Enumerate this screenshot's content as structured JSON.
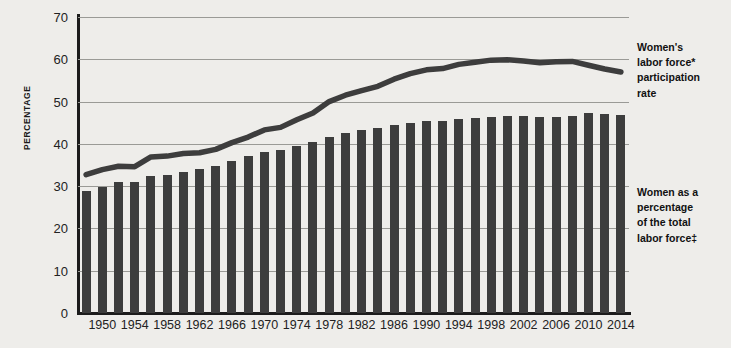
{
  "chart_data": {
    "type": "bar",
    "title": "",
    "xlabel": "",
    "ylabel": "PERCENTAGE",
    "ylim": [
      0,
      70
    ],
    "ytick_step": 10,
    "grid": true,
    "legend_position": "right-inline-annotations",
    "yticks": [
      "70",
      "60",
      "50",
      "40",
      "30",
      "20",
      "10",
      "0"
    ],
    "xticks": [
      "1950",
      "1954",
      "1958",
      "1962",
      "1966",
      "1970",
      "1974",
      "1978",
      "1982",
      "1986",
      "1990",
      "1994",
      "1998",
      "2002",
      "2006",
      "2010",
      "2014"
    ],
    "x": [
      1948,
      1950,
      1952,
      1954,
      1956,
      1958,
      1960,
      1962,
      1964,
      1966,
      1968,
      1970,
      1972,
      1974,
      1976,
      1978,
      1980,
      1982,
      1984,
      1986,
      1988,
      1990,
      1992,
      1994,
      1996,
      1998,
      2000,
      2002,
      2004,
      2006,
      2008,
      2010,
      2012,
      2014
    ],
    "series": [
      {
        "name": "Women as a percentage of the total labor force",
        "type": "bar",
        "color": "#3d3d3d",
        "values": [
          28.8,
          29.9,
          31.0,
          31.0,
          32.4,
          32.7,
          33.3,
          34.0,
          34.7,
          36.0,
          37.1,
          38.1,
          38.5,
          39.4,
          40.5,
          41.7,
          42.5,
          43.3,
          43.8,
          44.5,
          45.0,
          45.3,
          45.5,
          46.0,
          46.2,
          46.3,
          46.6,
          46.6,
          46.4,
          46.3,
          46.5,
          47.2,
          47.0,
          46.9
        ]
      },
      {
        "name": "Women's labor force participation rate",
        "type": "line",
        "color": "#3d3d3d",
        "values": [
          32.7,
          33.9,
          34.7,
          34.6,
          36.9,
          37.1,
          37.7,
          37.9,
          38.7,
          40.3,
          41.6,
          43.3,
          43.9,
          45.7,
          47.3,
          50.0,
          51.5,
          52.6,
          53.6,
          55.3,
          56.6,
          57.5,
          57.8,
          58.8,
          59.3,
          59.8,
          59.9,
          59.6,
          59.2,
          59.4,
          59.5,
          58.6,
          57.7,
          57.0
        ]
      }
    ],
    "annotations": [
      {
        "id": "line-annotation",
        "text": "Women's labor force* participation rate",
        "target_series": "Women's labor force participation rate"
      },
      {
        "id": "bar-annotation",
        "text": "Women as a percentage of the total labor force‡",
        "target_series": "Women as a percentage of the total labor force"
      }
    ]
  },
  "annotations": {
    "line_label_lines": [
      "Women's",
      "labor force*",
      "participation",
      "rate"
    ],
    "bar_label_lines": [
      "Women as a",
      "percentage",
      "of the total",
      "labor force‡"
    ]
  },
  "colors": {
    "background": "#eeedea",
    "ink": "#3d3d3d",
    "grid": "#9a9a96",
    "axis": "#1c1c1c"
  }
}
